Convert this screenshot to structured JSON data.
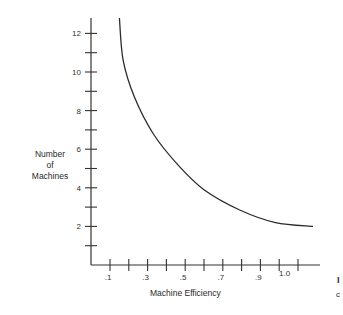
{
  "chart_data": {
    "type": "line",
    "title": "",
    "xlabel": "Machine Efficiency",
    "ylabel": "Number of Machines",
    "ylabel_lines": [
      "Number",
      "of",
      "Machines"
    ],
    "x_tick_labels": [
      ".1",
      ".3",
      ".5",
      ".7",
      ".9",
      "1.0"
    ],
    "x_tick_values": [
      0.1,
      0.3,
      0.5,
      0.7,
      0.9,
      1.0
    ],
    "x_minor_ticks": [
      0.1,
      0.2,
      0.3,
      0.4,
      0.5,
      0.6,
      0.7,
      0.8,
      0.9,
      1.0,
      1.1
    ],
    "y_tick_labels": [
      "2",
      "4",
      "6",
      "8",
      "10",
      "12"
    ],
    "y_tick_values": [
      2,
      4,
      6,
      8,
      10,
      12
    ],
    "y_minor_ticks": [
      1,
      2,
      3,
      4,
      5,
      6,
      7,
      8,
      9,
      10,
      11,
      12
    ],
    "xlim": [
      0.0,
      1.15
    ],
    "ylim": [
      0,
      13
    ],
    "grid": false,
    "legend": null,
    "series": [
      {
        "name": "Number of Machines vs Machine Efficiency",
        "x": [
          0.15,
          0.17,
          0.23,
          0.33,
          0.46,
          0.6,
          0.79,
          0.98,
          1.18
        ],
        "y": [
          12.8,
          10.6,
          8.7,
          6.8,
          5.2,
          3.9,
          2.85,
          2.2,
          2.0
        ]
      }
    ]
  },
  "edge_text": {
    "glyph_1": "I",
    "glyph_2": "c"
  }
}
